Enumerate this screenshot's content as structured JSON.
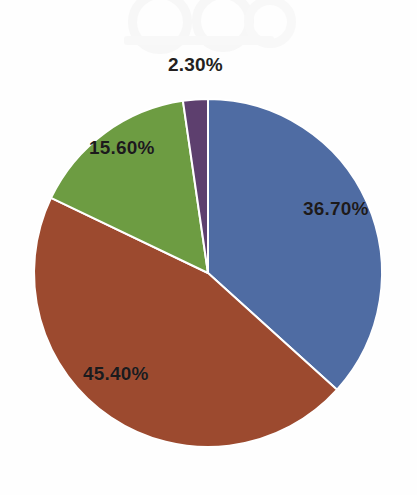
{
  "page": {
    "background_color": "#fefefe",
    "width": 417,
    "height": 495
  },
  "watermark": {
    "present": true,
    "description": "faint gray bleed-through artifact",
    "color": "#ededed"
  },
  "chart_data": {
    "type": "pie",
    "title": "",
    "subtitle": "",
    "xlabel": "",
    "ylabel": "",
    "grid": false,
    "legend": "none",
    "label_format": "percent",
    "start_angle_deg": 0,
    "direction": "clockwise",
    "center": {
      "x": 208,
      "y": 273
    },
    "radius": 174,
    "separator_color": "#ffffff",
    "categories": [
      "Series 1",
      "Series 2",
      "Series 3",
      "Series 4"
    ],
    "values": [
      36.7,
      45.4,
      15.6,
      2.3
    ],
    "labels": [
      "36.70%",
      "45.40%",
      "15.60%",
      "2.30%"
    ],
    "colors": [
      "#4f6ca3",
      "#9c4a2f",
      "#6d9c42",
      "#5d3f6e"
    ],
    "total": 100.0,
    "slices": [
      {
        "label": "36.70%",
        "value": 36.7,
        "color": "#4f6ca3",
        "name": "blue-slice"
      },
      {
        "label": "45.40%",
        "value": 45.4,
        "color": "#9c4a2f",
        "name": "red-slice"
      },
      {
        "label": "15.60%",
        "value": 15.6,
        "color": "#6d9c42",
        "name": "green-slice"
      },
      {
        "label": "2.30%",
        "value": 2.3,
        "color": "#5d3f6e",
        "name": "purple-slice"
      }
    ]
  }
}
